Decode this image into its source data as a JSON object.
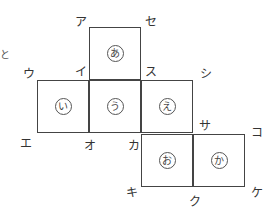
{
  "figure": {
    "type": "cube-net",
    "faces": [
      {
        "id": "a",
        "label": "あ",
        "row": 0,
        "col": 1
      },
      {
        "id": "i",
        "label": "い",
        "row": 1,
        "col": 0
      },
      {
        "id": "u",
        "label": "う",
        "row": 1,
        "col": 1
      },
      {
        "id": "e",
        "label": "え",
        "row": 1,
        "col": 2
      },
      {
        "id": "o",
        "label": "お",
        "row": 2,
        "col": 2
      },
      {
        "id": "ka",
        "label": "か",
        "row": 2,
        "col": 3
      }
    ],
    "vertices": [
      {
        "id": "A",
        "label": "ア"
      },
      {
        "id": "SE",
        "label": "セ"
      },
      {
        "id": "I",
        "label": "イ"
      },
      {
        "id": "SU",
        "label": "ス"
      },
      {
        "id": "U",
        "label": "ウ"
      },
      {
        "id": "SHI",
        "label": "シ"
      },
      {
        "id": "E",
        "label": "エ"
      },
      {
        "id": "O",
        "label": "オ"
      },
      {
        "id": "KA",
        "label": "カ"
      },
      {
        "id": "SA",
        "label": "サ"
      },
      {
        "id": "KO",
        "label": "コ"
      },
      {
        "id": "KI",
        "label": "キ"
      },
      {
        "id": "KU",
        "label": "ク"
      },
      {
        "id": "KE",
        "label": "ケ"
      }
    ],
    "edge_fragment": "と"
  }
}
